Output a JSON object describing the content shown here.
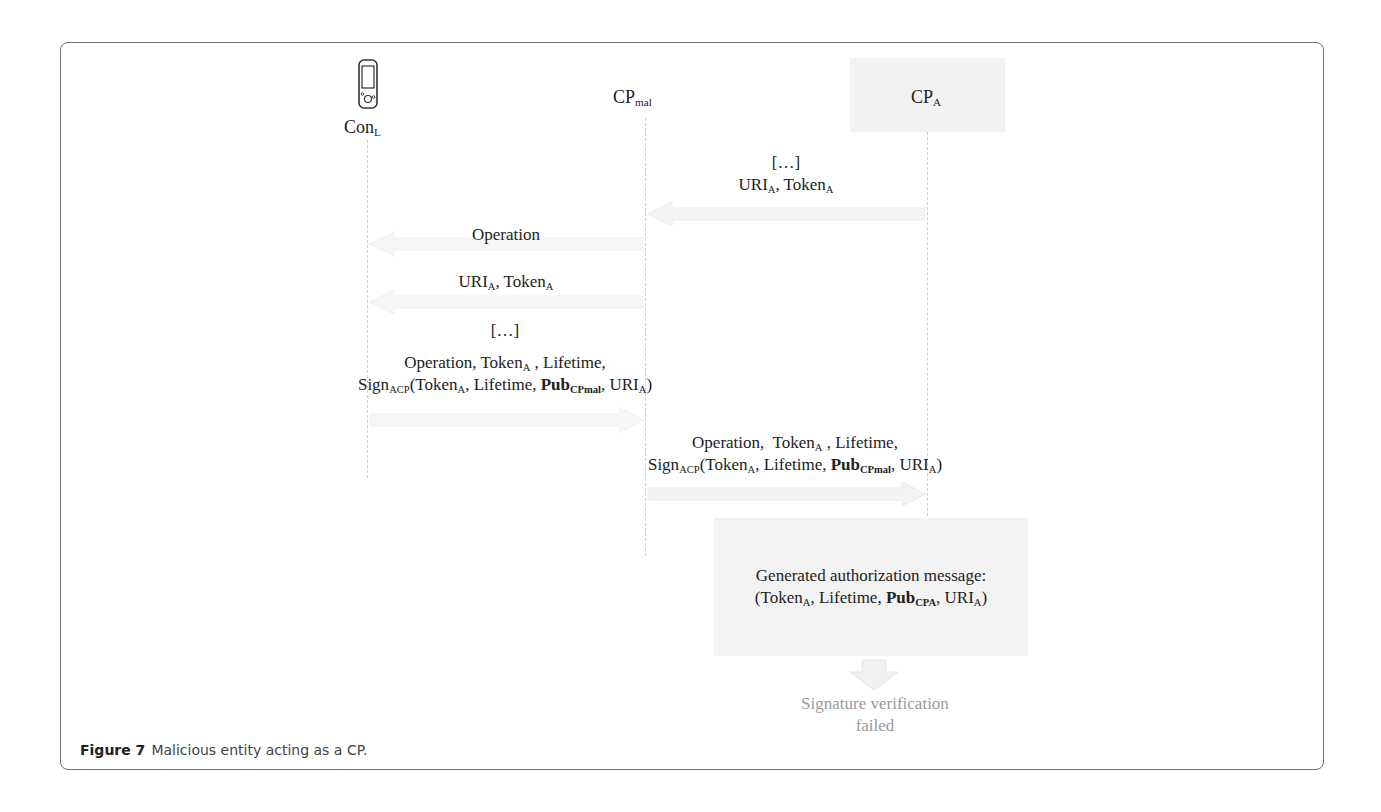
{
  "figure": {
    "caption_label": "Figure 7",
    "caption_text": "Malicious entity acting as a CP."
  },
  "participants": [
    {
      "id": "con_l",
      "base": "Con",
      "sub": "L",
      "icon": "mobile-phone-icon"
    },
    {
      "id": "cp_mal",
      "base": "CP",
      "sub": "mal"
    },
    {
      "id": "cp_a",
      "base": "CP",
      "sub": "A"
    }
  ],
  "messages": [
    {
      "from": "cp_a",
      "to": "cp_mal",
      "lines": [
        "[…]",
        "URI_A, Token_A"
      ]
    },
    {
      "from": "cp_mal",
      "to": "con_l",
      "lines": [
        "Operation"
      ]
    },
    {
      "from": "cp_mal",
      "to": "con_l",
      "lines": [
        "URI_A, Token_A"
      ]
    },
    {
      "from": "con_l",
      "to": "cp_mal",
      "lines": [
        "[…]",
        "Operation, Token_A , Lifetime,",
        "Sign_ACP(Token_A, Lifetime, Pub_CPmal, URI_A)"
      ]
    },
    {
      "from": "cp_mal",
      "to": "cp_a",
      "lines": [
        "Operation,  Token_A , Lifetime,",
        "Sign_ACP(Token_A, Lifetime, Pub_CPmal, URI_A)"
      ]
    }
  ],
  "labels": {
    "con_l_base": "Con",
    "con_l_sub": "L",
    "cp_mal_base": "CP",
    "cp_mal_sub": "mal",
    "cp_a_base": "CP",
    "cp_a_sub": "A",
    "ellipsis": "[…]",
    "uri": "URI",
    "token": "Token",
    "sub_a": "A",
    "operation": "Operation",
    "operation_comma": "Operation,",
    "lifetime": "Lifetime,",
    "lifetime_plain": "Lifetime",
    "sign": "Sign",
    "sign_sub": "ACP",
    "pub": "Pub",
    "pub_sub_mal": "CPmal",
    "pub_sub_a": "CPA",
    "gen_title": "Generated authorization message:",
    "fail_line1": "Signature verification",
    "fail_line2": "failed"
  }
}
